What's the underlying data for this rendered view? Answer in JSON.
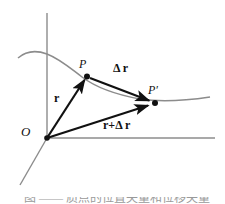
{
  "figure": {
    "background_color": "#ffffff",
    "axis_color": "#8c8c8c",
    "curve_color": "#8c8c8c",
    "vector_color": "#111111",
    "point_color": "#111111"
  },
  "labels": {
    "origin": "O",
    "point_p": "P",
    "point_p_prime": "P′",
    "vector_r": "r",
    "vector_delta_r": "Δ r",
    "vector_r_plus_delta_r": "r+Δ r"
  },
  "caption": {
    "text": "图  ——  质点的位置矢量和位移矢量"
  },
  "axes": [
    {
      "name": "y-axis",
      "from": [
        47,
        13
      ],
      "to": [
        47,
        138
      ]
    },
    {
      "name": "x-axis",
      "from": [
        47,
        138
      ],
      "to": [
        215,
        138
      ]
    },
    {
      "name": "z-axis",
      "from": [
        47,
        138
      ],
      "to": [
        20,
        185
      ]
    }
  ],
  "curve": {
    "name": "trajectory-path",
    "points": [
      [
        18,
        58
      ],
      [
        30,
        52
      ],
      [
        44,
        53
      ],
      [
        60,
        60
      ],
      [
        75,
        70
      ],
      [
        90,
        80
      ],
      [
        110,
        90
      ],
      [
        135,
        97
      ],
      [
        160,
        101
      ],
      [
        185,
        100
      ],
      [
        210,
        97
      ]
    ]
  },
  "vectors": [
    {
      "name": "vector-r",
      "from": [
        47,
        138
      ],
      "to": [
        87,
        76
      ]
    },
    {
      "name": "vector-delta-r",
      "from": [
        90,
        78
      ],
      "to": [
        155,
        103
      ]
    },
    {
      "name": "vector-r-plus-delta-r",
      "from": [
        47,
        138
      ],
      "to": [
        155,
        103
      ]
    }
  ],
  "points": [
    {
      "name": "origin-point",
      "at": [
        47,
        138
      ]
    },
    {
      "name": "point-P",
      "at": [
        87,
        76
      ]
    },
    {
      "name": "point-P-prime",
      "at": [
        155,
        103
      ]
    }
  ]
}
